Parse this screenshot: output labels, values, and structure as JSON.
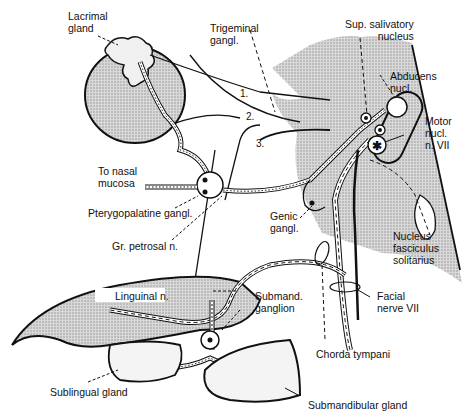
{
  "diagram": {
    "labels": {
      "lacrimal_gland": "Lacrimal\ngland",
      "trigeminal_gangl": "Trigeminal\ngangl.",
      "sup_salivatory_nucleus": "Sup. salivatory\nnucleus",
      "abducens_nucl": "Abducens\nnucl.",
      "motor_nucl": "Motor\nnucl.\nn. VII",
      "to_nasal_mucosa": "To nasal\nmucosa",
      "pterygopalatine_gangl": "Pterygopalatine gangl.",
      "gr_petrosal_n": "Gr. petrosal n.",
      "genic_gangl": "Genic\ngangl.",
      "nucleus_fasciculus_solitarius": "Nucleus\nfasciculus\nsolitarius",
      "linguinal_n": "Linguinal n.",
      "submand_ganglion": "Submand.\nganglion",
      "facial_nerve_vii": "Facial\nnerve VII",
      "chorda_tympani": "Chorda tympani",
      "sublingual_gland": "Sublingual gland",
      "submandibular_gland": "Submandibular gland"
    },
    "trigeminal_branches": [
      "1.",
      "2.",
      "3."
    ],
    "colors": {
      "line": "#111111",
      "stipple": "#bdbdbd",
      "background": "#ffffff"
    }
  }
}
